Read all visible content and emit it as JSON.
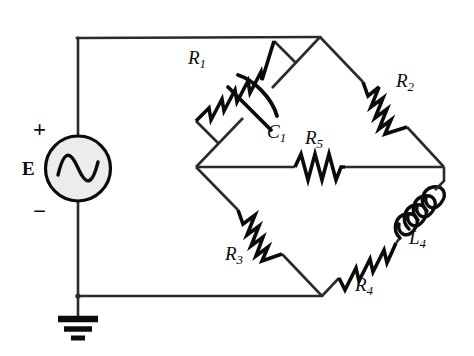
{
  "diagram": {
    "background_color": "#ffffff",
    "wire_color": "#2b2b2b",
    "component_color": "#0b0b0b",
    "source": {
      "symbol": "ac-voltage-source",
      "label": "E",
      "plus_sign": "+",
      "minus_sign": "−",
      "fill": "#ececec"
    },
    "ground": {
      "symbol": "earth-ground",
      "bars": 3
    },
    "components": [
      {
        "id": "R1",
        "type": "resistor",
        "label": "R",
        "subscript": "1",
        "branch": "top-left-diagonal-parallel-upper"
      },
      {
        "id": "C1",
        "type": "capacitor",
        "label": "C",
        "subscript": "1",
        "branch": "top-left-diagonal-parallel-lower"
      },
      {
        "id": "R2",
        "type": "resistor",
        "label": "R",
        "subscript": "2",
        "branch": "top-right-diagonal"
      },
      {
        "id": "R5",
        "type": "resistor",
        "label": "R",
        "subscript": "5",
        "branch": "middle-horizontal-bridge"
      },
      {
        "id": "R3",
        "type": "resistor",
        "label": "R",
        "subscript": "3",
        "branch": "bottom-left-diagonal"
      },
      {
        "id": "R4",
        "type": "resistor",
        "label": "R",
        "subscript": "4",
        "branch": "bottom-right-diagonal-lower"
      },
      {
        "id": "L4",
        "type": "inductor",
        "label": "L",
        "subscript": "4",
        "branch": "bottom-right-diagonal-upper"
      }
    ],
    "nodes": [
      {
        "id": "top",
        "x": 320,
        "y": 37
      },
      {
        "id": "left",
        "x": 196,
        "y": 167
      },
      {
        "id": "right",
        "x": 444,
        "y": 167
      },
      {
        "id": "bottom",
        "x": 322,
        "y": 296
      }
    ]
  }
}
